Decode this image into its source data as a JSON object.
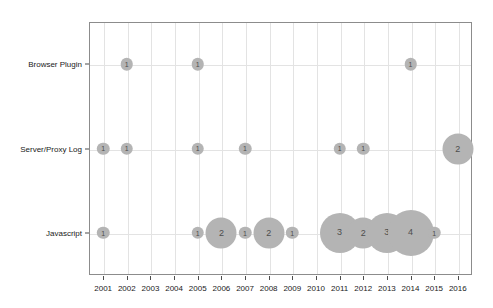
{
  "chart_data": {
    "type": "scatter",
    "subtype": "bubble-count-matrix",
    "title": "",
    "subtitle": "",
    "xlabel": "",
    "ylabel": "",
    "grid": true,
    "legend": false,
    "legend_position": "none",
    "bubble_color": "#b4b4b4",
    "bubble_label_color": "#4d4d4d",
    "axis_color": "#8c8c8c",
    "grid_color": "#e3e3e3",
    "x": [
      2001,
      2002,
      2003,
      2004,
      2005,
      2006,
      2007,
      2008,
      2009,
      2010,
      2011,
      2012,
      2013,
      2014,
      2015,
      2016
    ],
    "xtick_labels": [
      "2001",
      "2002",
      "2003",
      "2004",
      "2005",
      "2006",
      "2007",
      "2008",
      "2009",
      "2010",
      "2011",
      "2012",
      "2013",
      "2014",
      "2015",
      "2016"
    ],
    "xlim": [
      2000.4,
      2016.6
    ],
    "categories": [
      "Javascript",
      "Server/Proxy Log",
      "Browser Plugin"
    ],
    "ytick_labels": [
      "Browser Plugin",
      "Server/Proxy Log",
      "Javascript"
    ],
    "series": [
      {
        "name": "Browser Plugin",
        "points": [
          {
            "x": 2002,
            "value": 1
          },
          {
            "x": 2005,
            "value": 1
          },
          {
            "x": 2014,
            "value": 1
          }
        ]
      },
      {
        "name": "Server/Proxy Log",
        "points": [
          {
            "x": 2001,
            "value": 1
          },
          {
            "x": 2002,
            "value": 1
          },
          {
            "x": 2005,
            "value": 1
          },
          {
            "x": 2007,
            "value": 1
          },
          {
            "x": 2011,
            "value": 1
          },
          {
            "x": 2012,
            "value": 1
          },
          {
            "x": 2016,
            "value": 2
          }
        ]
      },
      {
        "name": "Javascript",
        "points": [
          {
            "x": 2001,
            "value": 1
          },
          {
            "x": 2005,
            "value": 1
          },
          {
            "x": 2006,
            "value": 2
          },
          {
            "x": 2007,
            "value": 1
          },
          {
            "x": 2008,
            "value": 2
          },
          {
            "x": 2009,
            "value": 1
          },
          {
            "x": 2011,
            "value": 3
          },
          {
            "x": 2012,
            "value": 2
          },
          {
            "x": 2013,
            "value": 3
          },
          {
            "x": 2014,
            "value": 4
          },
          {
            "x": 2015,
            "value": 1
          }
        ]
      }
    ]
  }
}
